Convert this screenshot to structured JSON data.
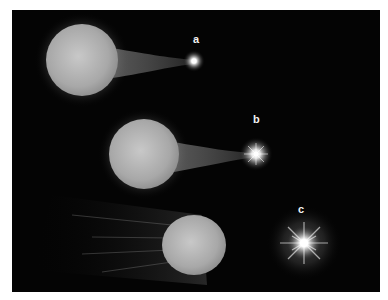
{
  "figure": {
    "background_color": "#040404",
    "star_color": "#b9b9b9",
    "glow_color": "#ffffff",
    "panels": [
      {
        "id": "a",
        "label": "a",
        "companion": "small bright point with thin gas stream"
      },
      {
        "id": "b",
        "label": "b",
        "companion": "bright star with rays and gas stream"
      },
      {
        "id": "c",
        "label": "c",
        "companion": "bright starburst with large halo; large star with trailing streaks"
      }
    ]
  }
}
